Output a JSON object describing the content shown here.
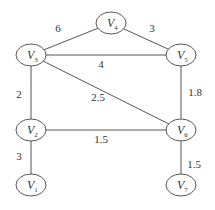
{
  "graph": {
    "title": "",
    "nodes": [
      {
        "id": "V1",
        "label": "V",
        "sub": "1",
        "x": 31,
        "y": 185
      },
      {
        "id": "V2",
        "label": "V",
        "sub": "2",
        "x": 31,
        "y": 130
      },
      {
        "id": "V3",
        "label": "V",
        "sub": "3",
        "x": 31,
        "y": 55
      },
      {
        "id": "V4",
        "label": "V",
        "sub": "4",
        "x": 111,
        "y": 23
      },
      {
        "id": "V5",
        "label": "V",
        "sub": "5",
        "x": 181,
        "y": 55
      },
      {
        "id": "V6",
        "label": "V",
        "sub": "6",
        "x": 181,
        "y": 130
      },
      {
        "id": "V7",
        "label": "V",
        "sub": "7",
        "x": 181,
        "y": 185
      }
    ],
    "edges": [
      {
        "from": "V3",
        "to": "V4",
        "weight": "6",
        "lx": 58,
        "ly": 32
      },
      {
        "from": "V4",
        "to": "V5",
        "weight": "3",
        "lx": 152,
        "ly": 32
      },
      {
        "from": "V3",
        "to": "V5",
        "weight": "4",
        "lx": 101,
        "ly": 68
      },
      {
        "from": "V3",
        "to": "V2",
        "weight": "2",
        "lx": 19,
        "ly": 98
      },
      {
        "from": "V3",
        "to": "V6",
        "weight": "2.5",
        "lx": 98,
        "ly": 101
      },
      {
        "from": "V5",
        "to": "V6",
        "weight": "1.8",
        "lx": 195,
        "ly": 96
      },
      {
        "from": "V2",
        "to": "V6",
        "weight": "1.5",
        "lx": 101,
        "ly": 143
      },
      {
        "from": "V2",
        "to": "V1",
        "weight": "3",
        "lx": 19,
        "ly": 160
      },
      {
        "from": "V6",
        "to": "V7",
        "weight": "1.5",
        "lx": 194,
        "ly": 168
      }
    ]
  }
}
